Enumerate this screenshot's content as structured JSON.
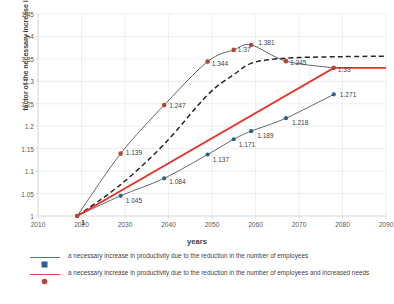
{
  "chart_data": {
    "type": "line",
    "title": "",
    "xlabel": "years",
    "ylabel": "factor of the necessary increase in productivity",
    "xlim": [
      2010,
      2090
    ],
    "ylim": [
      1,
      1.45
    ],
    "xticks": [
      2010,
      2020,
      2030,
      2040,
      2050,
      2060,
      2070,
      2080,
      2090
    ],
    "yticks": [
      1,
      1.05,
      1.1,
      1.15,
      1.2,
      1.25,
      1.3,
      1.35,
      1.4,
      1.45
    ],
    "xtick_labels": [
      "2010",
      "2020",
      "2030",
      "2040",
      "2050",
      "2060",
      "2070",
      "2080",
      "2090"
    ],
    "ytick_labels": [
      "1",
      "1.05",
      "1.1",
      "1.15",
      "1.2",
      "1.25",
      "1.3",
      "1.35",
      "1.4",
      "1.45"
    ],
    "grid": true,
    "legend_position": "bottom",
    "series": [
      {
        "name": "a necessary increase in productivity due to the reduction in the number of employees",
        "marker_color": "#2e5f8a",
        "line_color": "#404040",
        "x": [
          2019,
          2029,
          2039,
          2049,
          2055,
          2059,
          2067,
          2078
        ],
        "values": [
          1,
          1.045,
          1.084,
          1.137,
          1.171,
          1.189,
          1.218,
          1.271
        ],
        "point_labels": [
          "1",
          "1.045",
          "1.084",
          "1.137",
          "1.171",
          "1.189",
          "1.218",
          "1.271"
        ]
      },
      {
        "name": "a necessary increase in productivity due to the reduction in the number of employees and increased needs",
        "marker_color": "#b5453c",
        "line_color": "#404040",
        "x": [
          2019,
          2029,
          2039,
          2049,
          2055,
          2059,
          2067,
          2078
        ],
        "values": [
          1,
          1.139,
          1.247,
          1.344,
          1.37,
          1.381,
          1.345,
          1.33
        ],
        "point_labels": [
          "1",
          "1.139",
          "1.247",
          "1.344",
          "1.37",
          "1.381",
          "1.345",
          "1.33"
        ]
      },
      {
        "name": "trend-dashed",
        "style": "dashed",
        "line_color": "#262626",
        "x": [
          2019,
          2029,
          2039,
          2049,
          2055,
          2059,
          2064,
          2070,
          2080,
          2090
        ],
        "values": [
          1,
          1.07,
          1.16,
          1.27,
          1.315,
          1.34,
          1.349,
          1.353,
          1.355,
          1.356
        ]
      },
      {
        "name": "trend-red-straight",
        "style": "solid-thick",
        "line_color": "#e8332a",
        "x": [
          2019,
          2078,
          2090
        ],
        "values": [
          1,
          1.33,
          1.33
        ]
      }
    ]
  },
  "legend": {
    "entries": [
      {
        "label": "a necessary increase in productivity due to the reduction in the number of employees",
        "marker_color": "#2e5f8a",
        "line_color": "#4472a8"
      },
      {
        "label": "a necessary increase in productivity due to the reduction in the number of employees and increased needs",
        "marker_color": "#b5453c",
        "line_color": "#d44a3f"
      }
    ]
  },
  "colors": {
    "grid": "#e8e8e8",
    "axis": "#d9d9d9",
    "text": "#595959",
    "blue_marker": "#2e5f8a",
    "red_marker": "#b5453c",
    "red_line": "#e8332a",
    "curve": "#404040"
  }
}
